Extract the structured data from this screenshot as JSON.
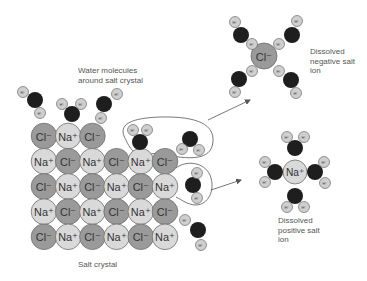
{
  "labels": {
    "water_molecules": "Water molecules\naround salt crystal",
    "salt_crystal": "Salt crystal",
    "dissolved_negative": "Dissolved\nnegative salt\nion",
    "dissolved_positive": "Dissolved\npositive salt\nion"
  },
  "colors": {
    "cl_fill": "#9a9a9a",
    "na_fill": "#d9d9d9",
    "ion_stroke": "#6e6e6e",
    "oxygen_fill": "#1e1e1e",
    "hydrogen_fill": "#cfcfcf",
    "line": "#555555"
  },
  "symbols": {
    "cl": "Cl⁻",
    "na": "Na⁺",
    "h": "H⁺",
    "o": "O"
  },
  "crystal": {
    "origin_x": 44,
    "origin_y": 136,
    "dx": 24.2,
    "dy": 25.2,
    "radius": 12.8,
    "rows": [
      [
        "Cl",
        "Na",
        "Cl"
      ],
      [
        "Na",
        "Cl",
        "Na",
        "Cl",
        "Na",
        "Cl"
      ],
      [
        "Cl",
        "Na",
        "Cl",
        "Na",
        "Cl",
        "Na"
      ],
      [
        "Na",
        "Cl",
        "Na",
        "Cl",
        "Na",
        "Cl"
      ],
      [
        "Cl",
        "Na",
        "Cl",
        "Na",
        "Cl",
        "Na"
      ]
    ]
  },
  "water_molecules": [
    {
      "o": [
        35,
        100
      ],
      "h": [
        [
          23,
          92
        ],
        [
          40,
          113
        ]
      ]
    },
    {
      "o": [
        72,
        114
      ],
      "h": [
        [
          62,
          104
        ],
        [
          81,
          104
        ]
      ]
    },
    {
      "o": [
        104,
        104
      ],
      "h": [
        [
          117,
          94
        ],
        [
          101,
          118
        ]
      ]
    },
    {
      "o": [
        140,
        142
      ],
      "h": [
        [
          133,
          130
        ],
        [
          147,
          130
        ]
      ]
    },
    {
      "o": [
        190,
        139
      ],
      "h": [
        [
          182,
          149
        ],
        [
          199,
          150
        ]
      ]
    },
    {
      "o": [
        193,
        185
      ],
      "h": [
        [
          197,
          173
        ],
        [
          197,
          198
        ]
      ]
    },
    {
      "o": [
        198,
        230
      ],
      "h": [
        [
          185,
          220
        ],
        [
          201,
          245
        ]
      ]
    },
    {
      "o": [
        241,
        35
      ],
      "h": [
        [
          235,
          22
        ],
        [
          252,
          44
        ]
      ]
    },
    {
      "o": [
        292,
        35
      ],
      "h": [
        [
          297,
          21
        ],
        [
          279,
          44
        ]
      ]
    },
    {
      "o": [
        239,
        79
      ],
      "h": [
        [
          252,
          71
        ],
        [
          235,
          92
        ]
      ]
    },
    {
      "o": [
        291,
        80
      ],
      "h": [
        [
          279,
          71
        ],
        [
          296,
          93
        ]
      ]
    },
    {
      "o": [
        295,
        148
      ],
      "h": [
        [
          287,
          137
        ],
        [
          304,
          137
        ]
      ]
    },
    {
      "o": [
        275,
        172
      ],
      "h": [
        [
          265,
          162
        ],
        [
          265,
          182
        ]
      ]
    },
    {
      "o": [
        315,
        172
      ],
      "h": [
        [
          324,
          162
        ],
        [
          325,
          183
        ]
      ]
    },
    {
      "o": [
        295,
        196
      ],
      "h": [
        [
          287,
          207
        ],
        [
          304,
          207
        ]
      ]
    }
  ],
  "dissolved_ions": [
    {
      "type": "Cl",
      "x": 264,
      "y": 56,
      "r": 13
    },
    {
      "type": "Na",
      "x": 295,
      "y": 172,
      "r": 12
    }
  ],
  "arrows": [
    {
      "x1": 208,
      "y1": 120,
      "x2": 250,
      "y2": 100
    },
    {
      "x1": 211,
      "y1": 190,
      "x2": 241,
      "y2": 180
    }
  ]
}
